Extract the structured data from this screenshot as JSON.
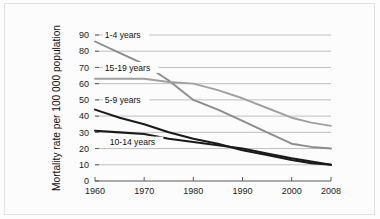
{
  "figure": {
    "background_color": "#fcfcfc",
    "border_color": "#e2e2e2"
  },
  "chart_data": {
    "type": "line",
    "title": "",
    "subtitle": "",
    "xlabel": "",
    "ylabel": "Mortality rate per 100 000 population",
    "xlim": [
      1960,
      2008
    ],
    "ylim": [
      0,
      90
    ],
    "grid": "horizontal",
    "legend_position": "inline-annotations",
    "x_tick_labels": [
      "1960",
      "1970",
      "1980",
      "1990",
      "2000",
      "2008"
    ],
    "x_ticks": [
      1960,
      1970,
      1980,
      1990,
      2000,
      2008
    ],
    "y_tick_labels": [
      "0",
      "10",
      "20",
      "30",
      "40",
      "50",
      "60",
      "70",
      "80",
      "90"
    ],
    "y_ticks": [
      0,
      10,
      20,
      30,
      40,
      50,
      60,
      70,
      80,
      90
    ],
    "x": [
      1960,
      1965,
      1970,
      1975,
      1980,
      1985,
      1990,
      1995,
      2000,
      2004,
      2008
    ],
    "series": [
      {
        "name": "1-4 years",
        "color": "#8c8c8c",
        "values": [
          86,
          79,
          72,
          62,
          50,
          44,
          37,
          30,
          23,
          21,
          20
        ]
      },
      {
        "name": "15-19 years",
        "color": "#a0a0a0",
        "values": [
          63,
          63,
          63,
          61,
          60,
          56,
          51,
          45,
          39,
          36,
          34
        ]
      },
      {
        "name": "5-9 years",
        "color": "#1a1a1a",
        "values": [
          44,
          39,
          35,
          30,
          26,
          23,
          19,
          16,
          13,
          11,
          10
        ]
      },
      {
        "name": "10-14 years",
        "color": "#1a1a1a",
        "values": [
          31,
          30,
          29,
          26,
          24,
          22,
          20,
          17,
          14,
          12,
          10
        ]
      }
    ],
    "annotations": [
      {
        "text": "1-4 years",
        "x": 1962,
        "y": 90
      },
      {
        "text": "15-19 years",
        "x": 1962,
        "y": 70
      },
      {
        "text": "5-9 years",
        "x": 1962,
        "y": 50
      },
      {
        "text": "10-14 years",
        "x": 1963,
        "y": 24
      }
    ]
  }
}
